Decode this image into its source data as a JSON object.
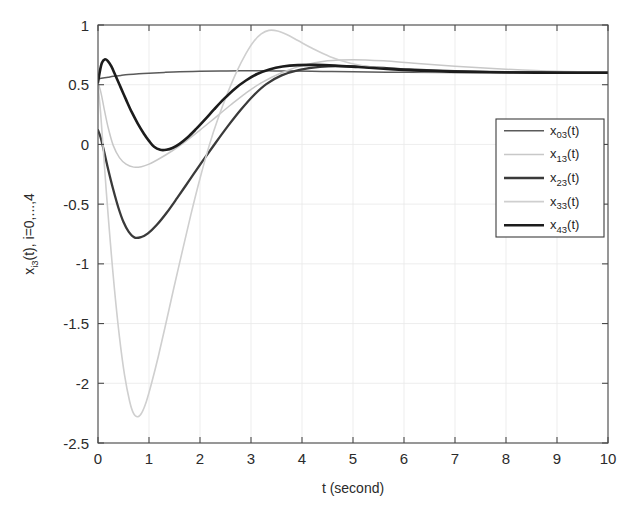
{
  "figure": {
    "background": "#ffffff",
    "plot_area": {
      "x": 98,
      "y": 25,
      "width": 510,
      "height": 418
    }
  },
  "chart_data": {
    "type": "line",
    "title": "",
    "xlabel": "t (second)",
    "ylabel": "x_i3(t), i=0,...,4",
    "ylabel_parts": {
      "base": "x",
      "subscript": "i3",
      "rest": "(t),  i=0,...,4"
    },
    "xlim": [
      0,
      10
    ],
    "ylim": [
      -2.5,
      1
    ],
    "xticks": [
      0,
      1,
      2,
      3,
      4,
      5,
      6,
      7,
      8,
      9,
      10
    ],
    "xticklabels": [
      "0",
      "1",
      "2",
      "3",
      "4",
      "5",
      "6",
      "7",
      "8",
      "9",
      "10"
    ],
    "yticks": [
      -2.5,
      -2,
      -1.5,
      -1,
      -0.5,
      0,
      0.5,
      1
    ],
    "yticklabels": [
      "-2.5",
      "-2",
      "-1.5",
      "-1",
      "-0.5",
      "0",
      "0.5",
      "1"
    ],
    "grid": true,
    "legend_position": "right-upper",
    "steady_state_value": 0.6,
    "series": [
      {
        "name": "x03(t)",
        "label_base": "x",
        "label_sub": "03",
        "label_rest": "(t)",
        "color": "#5a5a5a",
        "width": 1.5,
        "initial_value": 0.55,
        "points": [
          [
            0.0,
            0.548
          ],
          [
            0.1,
            0.556
          ],
          [
            0.2,
            0.563
          ],
          [
            0.3,
            0.57
          ],
          [
            0.45,
            0.578
          ],
          [
            0.6,
            0.585
          ],
          [
            0.8,
            0.592
          ],
          [
            1.0,
            0.597
          ],
          [
            1.3,
            0.603
          ],
          [
            1.6,
            0.608
          ],
          [
            2.0,
            0.612
          ],
          [
            2.4,
            0.615
          ],
          [
            2.8,
            0.616
          ],
          [
            3.3,
            0.616
          ],
          [
            3.8,
            0.614
          ],
          [
            4.4,
            0.611
          ],
          [
            5.0,
            0.608
          ],
          [
            6.0,
            0.604
          ],
          [
            7.0,
            0.602
          ],
          [
            8.0,
            0.601
          ],
          [
            9.0,
            0.6
          ],
          [
            10.0,
            0.6
          ]
        ]
      },
      {
        "name": "x13(t)",
        "label_base": "x",
        "label_sub": "13",
        "label_rest": "(t)",
        "color": "#c8c8c8",
        "width": 1.5,
        "initial_value": 0.52,
        "minimum": {
          "t": 0.78,
          "value": -0.19
        },
        "points": [
          [
            0.0,
            0.52
          ],
          [
            0.06,
            0.43
          ],
          [
            0.12,
            0.3
          ],
          [
            0.2,
            0.14
          ],
          [
            0.3,
            -0.01
          ],
          [
            0.42,
            -0.11
          ],
          [
            0.55,
            -0.165
          ],
          [
            0.7,
            -0.19
          ],
          [
            0.85,
            -0.186
          ],
          [
            1.0,
            -0.165
          ],
          [
            1.2,
            -0.12
          ],
          [
            1.45,
            -0.055
          ],
          [
            1.7,
            0.02
          ],
          [
            2.0,
            0.12
          ],
          [
            2.3,
            0.225
          ],
          [
            2.6,
            0.33
          ],
          [
            2.9,
            0.43
          ],
          [
            3.2,
            0.515
          ],
          [
            3.6,
            0.6
          ],
          [
            4.0,
            0.66
          ],
          [
            4.5,
            0.7
          ],
          [
            5.0,
            0.71
          ],
          [
            5.6,
            0.7
          ],
          [
            6.2,
            0.68
          ],
          [
            7.0,
            0.655
          ],
          [
            8.0,
            0.63
          ],
          [
            9.0,
            0.612
          ],
          [
            10.0,
            0.605
          ]
        ]
      },
      {
        "name": "x23(t)",
        "label_base": "x",
        "label_sub": "23",
        "label_rest": "(t)",
        "color": "#3a3a3a",
        "width": 2.3,
        "initial_value": 0.12,
        "minimum": {
          "t": 0.72,
          "value": -0.78
        },
        "points": [
          [
            0.0,
            0.12
          ],
          [
            0.05,
            0.06
          ],
          [
            0.12,
            -0.06
          ],
          [
            0.2,
            -0.21
          ],
          [
            0.3,
            -0.38
          ],
          [
            0.4,
            -0.53
          ],
          [
            0.5,
            -0.65
          ],
          [
            0.6,
            -0.73
          ],
          [
            0.72,
            -0.78
          ],
          [
            0.85,
            -0.775
          ],
          [
            0.98,
            -0.745
          ],
          [
            1.15,
            -0.675
          ],
          [
            1.35,
            -0.57
          ],
          [
            1.55,
            -0.45
          ],
          [
            1.8,
            -0.295
          ],
          [
            2.05,
            -0.14
          ],
          [
            2.3,
            0.01
          ],
          [
            2.55,
            0.155
          ],
          [
            2.8,
            0.29
          ],
          [
            3.05,
            0.41
          ],
          [
            3.3,
            0.505
          ],
          [
            3.6,
            0.578
          ],
          [
            3.95,
            0.625
          ],
          [
            4.35,
            0.65
          ],
          [
            4.8,
            0.655
          ],
          [
            5.4,
            0.645
          ],
          [
            6.1,
            0.628
          ],
          [
            7.0,
            0.614
          ],
          [
            8.0,
            0.606
          ],
          [
            9.0,
            0.602
          ],
          [
            10.0,
            0.6
          ]
        ]
      },
      {
        "name": "x33(t)",
        "label_base": "x",
        "label_sub": "33",
        "label_rest": "(t)",
        "color": "#cfcfcf",
        "width": 1.6,
        "initial_value": 0.5,
        "minimum": {
          "t": 0.76,
          "value": -2.28
        },
        "maximum": {
          "t": 3.3,
          "value": 0.955
        },
        "points": [
          [
            0.0,
            0.5
          ],
          [
            0.05,
            0.27
          ],
          [
            0.1,
            -0.02
          ],
          [
            0.16,
            -0.38
          ],
          [
            0.24,
            -0.81
          ],
          [
            0.32,
            -1.2
          ],
          [
            0.42,
            -1.61
          ],
          [
            0.52,
            -1.93
          ],
          [
            0.62,
            -2.15
          ],
          [
            0.7,
            -2.255
          ],
          [
            0.78,
            -2.28
          ],
          [
            0.86,
            -2.245
          ],
          [
            0.95,
            -2.15
          ],
          [
            1.05,
            -2.0
          ],
          [
            1.18,
            -1.78
          ],
          [
            1.32,
            -1.52
          ],
          [
            1.48,
            -1.215
          ],
          [
            1.65,
            -0.9
          ],
          [
            1.82,
            -0.59
          ],
          [
            2.0,
            -0.285
          ],
          [
            2.18,
            -0.01
          ],
          [
            2.36,
            0.225
          ],
          [
            2.55,
            0.44
          ],
          [
            2.72,
            0.61
          ],
          [
            2.9,
            0.76
          ],
          [
            3.05,
            0.86
          ],
          [
            3.2,
            0.925
          ],
          [
            3.35,
            0.955
          ],
          [
            3.52,
            0.95
          ],
          [
            3.7,
            0.92
          ],
          [
            3.92,
            0.87
          ],
          [
            4.2,
            0.805
          ],
          [
            4.55,
            0.735
          ],
          [
            4.95,
            0.68
          ],
          [
            5.4,
            0.645
          ],
          [
            5.9,
            0.622
          ],
          [
            6.5,
            0.608
          ],
          [
            7.2,
            0.602
          ],
          [
            8.0,
            0.6
          ],
          [
            9.0,
            0.6
          ],
          [
            10.0,
            0.6
          ]
        ]
      },
      {
        "name": "x43(t)",
        "label_base": "x",
        "label_sub": "43",
        "label_rest": "(t)",
        "color": "#1c1c1c",
        "width": 2.6,
        "initial_value": 0.52,
        "maximum": {
          "t": 0.13,
          "value": 0.712
        },
        "minimum": {
          "t": 1.08,
          "value": -0.045
        },
        "points": [
          [
            0.0,
            0.52
          ],
          [
            0.04,
            0.62
          ],
          [
            0.08,
            0.685
          ],
          [
            0.13,
            0.712
          ],
          [
            0.19,
            0.7
          ],
          [
            0.26,
            0.655
          ],
          [
            0.34,
            0.58
          ],
          [
            0.44,
            0.482
          ],
          [
            0.55,
            0.375
          ],
          [
            0.66,
            0.272
          ],
          [
            0.78,
            0.175
          ],
          [
            0.9,
            0.09
          ],
          [
            1.0,
            0.03
          ],
          [
            1.1,
            -0.02
          ],
          [
            1.22,
            -0.045
          ],
          [
            1.34,
            -0.045
          ],
          [
            1.46,
            -0.03
          ],
          [
            1.6,
            0.005
          ],
          [
            1.76,
            0.06
          ],
          [
            1.92,
            0.128
          ],
          [
            2.1,
            0.21
          ],
          [
            2.28,
            0.295
          ],
          [
            2.48,
            0.385
          ],
          [
            2.68,
            0.465
          ],
          [
            2.9,
            0.535
          ],
          [
            3.12,
            0.59
          ],
          [
            3.36,
            0.628
          ],
          [
            3.62,
            0.652
          ],
          [
            3.92,
            0.664
          ],
          [
            4.26,
            0.666
          ],
          [
            4.65,
            0.66
          ],
          [
            5.1,
            0.648
          ],
          [
            5.6,
            0.634
          ],
          [
            6.2,
            0.62
          ],
          [
            6.9,
            0.61
          ],
          [
            7.7,
            0.604
          ],
          [
            8.6,
            0.601
          ],
          [
            9.4,
            0.6
          ],
          [
            10.0,
            0.6
          ]
        ]
      }
    ]
  },
  "legend": {
    "box": {
      "x": 496,
      "y": 119,
      "width": 108,
      "height": 118
    },
    "items": [
      {
        "label_base": "x",
        "label_sub": "03",
        "label_rest": "(t)",
        "color": "#5a5a5a",
        "width": 1.5
      },
      {
        "label_base": "x",
        "label_sub": "13",
        "label_rest": "(t)",
        "color": "#c8c8c8",
        "width": 1.5
      },
      {
        "label_base": "x",
        "label_sub": "23",
        "label_rest": "(t)",
        "color": "#3a3a3a",
        "width": 2.3
      },
      {
        "label_base": "x",
        "label_sub": "33",
        "label_rest": "(t)",
        "color": "#cfcfcf",
        "width": 1.6
      },
      {
        "label_base": "x",
        "label_sub": "43",
        "label_rest": "(t)",
        "color": "#1c1c1c",
        "width": 2.6
      }
    ]
  }
}
